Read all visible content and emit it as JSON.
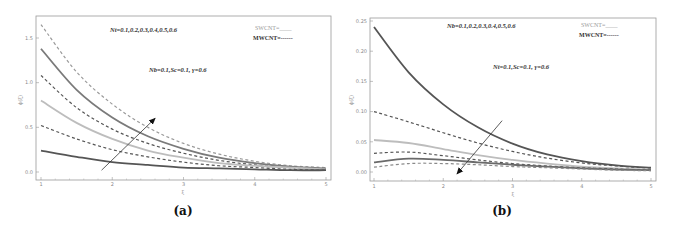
{
  "chart_data": [
    {
      "type": "line",
      "panel_label": "(a)",
      "title": "",
      "xlabel": "ξ",
      "ylabel": "ϕ(ξ)",
      "xlim": [
        1,
        5
      ],
      "ylim": [
        -0.05,
        1.75
      ],
      "xticks": [
        1,
        2,
        3,
        4,
        5
      ],
      "xtick_labels": [
        "1",
        "2",
        "3",
        "4",
        "5"
      ],
      "yticks": [
        0.0,
        0.5,
        1.0,
        1.5
      ],
      "ytick_labels": [
        "0.0",
        "0.5",
        "1.0",
        "1.5"
      ],
      "grid": false,
      "annotations": {
        "param_list": "Nt=0.1,0.2,0.3,0.4,0.5,0.6",
        "fixed_params": "Nb=0.1,Sc=0.1, γ=0.6"
      },
      "legend": {
        "placement": "top-right",
        "swcnt": "SWCNT=____",
        "mwcnt": "MWCNT=------"
      },
      "arrow": {
        "from": [
          1.85,
          0.02
        ],
        "to": [
          2.6,
          0.6
        ],
        "direction": "increasing"
      },
      "x": [
        1,
        1.5,
        2,
        2.5,
        3,
        3.5,
        4,
        4.5,
        5
      ],
      "series": [
        {
          "name": "Nt=0.6 MWCNT",
          "style": "dashed",
          "color": "#9a9a9a",
          "values": [
            1.65,
            1.12,
            0.76,
            0.5,
            0.32,
            0.2,
            0.12,
            0.07,
            0.05
          ]
        },
        {
          "name": "Nt=0.5 SWCNT",
          "style": "solid",
          "color": "#7a7a7a",
          "values": [
            1.38,
            0.92,
            0.61,
            0.4,
            0.26,
            0.16,
            0.1,
            0.06,
            0.04
          ]
        },
        {
          "name": "Nt=0.4 MWCNT",
          "style": "dashed",
          "color": "#555555",
          "values": [
            1.08,
            0.72,
            0.48,
            0.32,
            0.21,
            0.13,
            0.08,
            0.05,
            0.03
          ]
        },
        {
          "name": "Nt=0.3 SWCNT",
          "style": "solid",
          "color": "#bdbdbd",
          "values": [
            0.8,
            0.55,
            0.37,
            0.24,
            0.16,
            0.1,
            0.07,
            0.05,
            0.03
          ]
        },
        {
          "name": "Nt=0.2 MWCNT",
          "style": "dashed",
          "color": "#555555",
          "values": [
            0.52,
            0.37,
            0.25,
            0.17,
            0.11,
            0.07,
            0.05,
            0.03,
            0.02
          ]
        },
        {
          "name": "Nt=0.1 SWCNT",
          "style": "solid",
          "color": "#555555",
          "values": [
            0.24,
            0.17,
            0.11,
            0.08,
            0.05,
            0.04,
            0.03,
            0.02,
            0.02
          ]
        }
      ]
    },
    {
      "type": "line",
      "panel_label": "(b)",
      "title": "",
      "xlabel": "ξ",
      "ylabel": "ϕ(ξ)",
      "xlim": [
        1,
        5
      ],
      "ylim": [
        -0.008,
        0.255
      ],
      "xticks": [
        1,
        2,
        3,
        4,
        5
      ],
      "xtick_labels": [
        "1",
        "2",
        "3",
        "4",
        "5"
      ],
      "yticks": [
        0.0,
        0.05,
        0.1,
        0.15,
        0.2,
        0.25
      ],
      "ytick_labels": [
        "0.00",
        "0.05",
        "0.10",
        "0.15",
        "0.20",
        "0.25"
      ],
      "grid": false,
      "annotations": {
        "param_list": "Nb=0.1,0.2,0.3,0.4,0.5,0.6",
        "fixed_params": "Nt=0.1,Sc=0.1, γ=0.6"
      },
      "legend": {
        "placement": "top-right",
        "swcnt": "SWCNT=____",
        "mwcnt": "MWCNT=------"
      },
      "arrow": {
        "from": [
          2.85,
          0.085
        ],
        "to": [
          2.2,
          -0.003
        ],
        "direction": "decreasing"
      },
      "x": [
        1,
        1.5,
        2,
        2.5,
        3,
        3.5,
        4,
        4.5,
        5
      ],
      "series": [
        {
          "name": "Nb=0.1 SWCNT",
          "style": "solid",
          "color": "#555555",
          "values": [
            0.24,
            0.165,
            0.112,
            0.074,
            0.047,
            0.029,
            0.018,
            0.011,
            0.007
          ]
        },
        {
          "name": "Nb=0.2 MWCNT",
          "style": "dashed",
          "color": "#555555",
          "values": [
            0.1,
            0.083,
            0.065,
            0.048,
            0.034,
            0.023,
            0.015,
            0.01,
            0.006
          ]
        },
        {
          "name": "Nb=0.3 SWCNT",
          "style": "solid",
          "color": "#bdbdbd",
          "values": [
            0.053,
            0.048,
            0.038,
            0.028,
            0.02,
            0.014,
            0.009,
            0.006,
            0.004
          ]
        },
        {
          "name": "Nb=0.4 MWCNT",
          "style": "dashed",
          "color": "#555555",
          "values": [
            0.031,
            0.033,
            0.027,
            0.02,
            0.014,
            0.01,
            0.007,
            0.005,
            0.003
          ]
        },
        {
          "name": "Nb=0.5 SWCNT",
          "style": "solid",
          "color": "#6a6a6a",
          "values": [
            0.016,
            0.022,
            0.02,
            0.016,
            0.012,
            0.009,
            0.006,
            0.004,
            0.003
          ]
        },
        {
          "name": "Nb=0.6 MWCNT",
          "style": "dashed",
          "color": "#8a8a8a",
          "values": [
            0.008,
            0.014,
            0.014,
            0.012,
            0.009,
            0.007,
            0.005,
            0.003,
            0.002
          ]
        }
      ]
    }
  ]
}
